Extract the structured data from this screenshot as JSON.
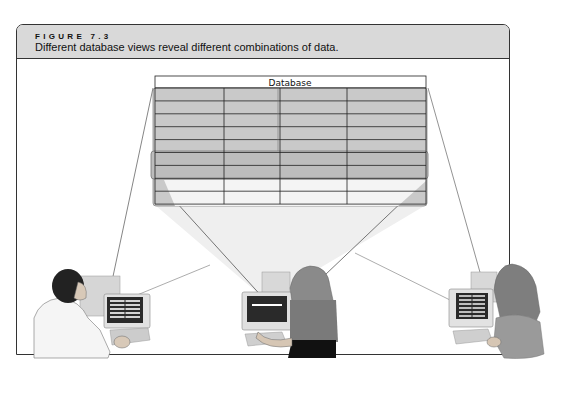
{
  "figure": {
    "label": "FIGURE 7.3",
    "caption": "Different database views reveal different combinations of data."
  },
  "database": {
    "title": "Database",
    "columns": 4,
    "rows": 9,
    "highlighted_views": [
      {
        "name": "view-all-upper",
        "rows": "1-5",
        "columns": "all"
      },
      {
        "name": "view-middle-rows",
        "rows": "6-7",
        "columns": "all"
      },
      {
        "name": "view-left-column",
        "rows": "all",
        "columns": "1"
      }
    ]
  },
  "users": [
    {
      "name": "user-left",
      "description": "man at computer",
      "screen": "table-columns"
    },
    {
      "name": "user-center",
      "description": "woman at computer",
      "screen": "single-row"
    },
    {
      "name": "user-right",
      "description": "woman at computer",
      "screen": "table-rows"
    }
  ],
  "colors": {
    "header_bg": "#d9d9d9",
    "table_shade": "#c8c8c8",
    "frame": "#333333"
  }
}
